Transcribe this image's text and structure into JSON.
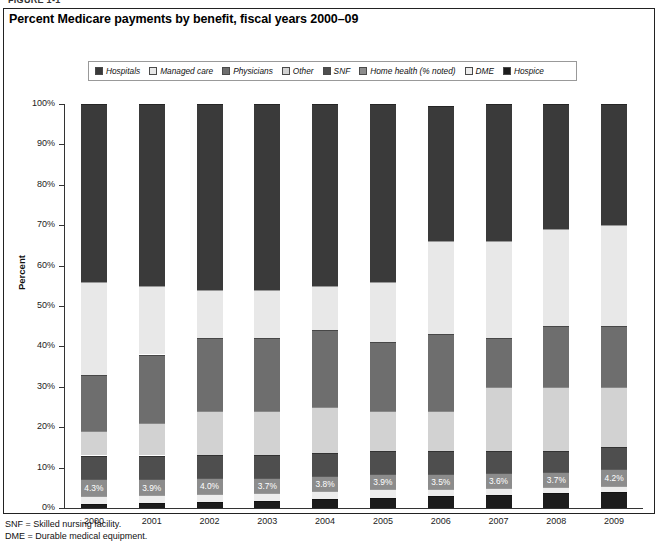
{
  "figure_label": "FIGURE 1-1",
  "title": "Percent Medicare payments by benefit, fiscal years 2000–09",
  "legend": {
    "items": [
      {
        "label": "Hospitals",
        "color": "#3a3a3a",
        "icon": "legend-swatch-icon"
      },
      {
        "label": "Managed care",
        "color": "#e8e8e8",
        "icon": "legend-swatch-icon"
      },
      {
        "label": "Physicians",
        "color": "#6e6e6e",
        "icon": "legend-swatch-icon"
      },
      {
        "label": "Other",
        "color": "#d2d2d2",
        "icon": "legend-swatch-icon"
      },
      {
        "label": "SNF",
        "color": "#4e4e4e",
        "icon": "legend-swatch-icon"
      },
      {
        "label": "Home health (% noted)",
        "color": "#8c8c8c",
        "icon": "legend-swatch-icon"
      },
      {
        "label": "DME",
        "color": "#ededed",
        "icon": "legend-swatch-icon"
      },
      {
        "label": "Hospice",
        "color": "#1c1c1c",
        "icon": "legend-swatch-icon"
      }
    ]
  },
  "footnotes": [
    "SNF = Skilled nursing facility.",
    "DME = Durable medical equipment."
  ],
  "chart_data": {
    "type": "bar",
    "subtype": "stacked-percent",
    "title": "Percent Medicare payments by benefit, fiscal years 2000–09",
    "xlabel": "",
    "ylabel": "Percent",
    "ylim": [
      0,
      100
    ],
    "ytick_labels": [
      "0%",
      "10%",
      "20%",
      "30%",
      "40%",
      "50%",
      "60%",
      "70%",
      "80%",
      "90%",
      "100%"
    ],
    "ytick_values": [
      0,
      10,
      20,
      30,
      40,
      50,
      60,
      70,
      80,
      90,
      100
    ],
    "grid": false,
    "legend_position": "top",
    "categories": [
      "2000",
      "2001",
      "2002",
      "2003",
      "2004",
      "2005",
      "2006",
      "2007",
      "2008",
      "2009"
    ],
    "stack_order_bottom_to_top": [
      "Hospice",
      "DME",
      "Home health (% noted)",
      "SNF",
      "Other",
      "Physicians",
      "Managed care",
      "Hospitals"
    ],
    "series": [
      {
        "name": "Hospice",
        "color": "#1c1c1c",
        "values": [
          1.0,
          1.2,
          1.5,
          1.8,
          2.2,
          2.6,
          3.0,
          3.3,
          3.6,
          3.9
        ]
      },
      {
        "name": "DME",
        "color": "#ededed",
        "values": [
          2.0,
          2.0,
          2.0,
          2.0,
          2.0,
          2.0,
          1.8,
          1.7,
          1.6,
          1.5
        ]
      },
      {
        "name": "Home health (% noted)",
        "color": "#8c8c8c",
        "values": [
          4.3,
          3.9,
          4.0,
          3.7,
          3.8,
          3.9,
          3.5,
          3.6,
          3.7,
          4.2
        ],
        "data_labels": [
          "4.3%",
          "3.9%",
          "4.0%",
          "3.7%",
          "3.8%",
          "3.9%",
          "3.5%",
          "3.6%",
          "3.7%",
          "4.2%"
        ]
      },
      {
        "name": "SNF",
        "color": "#4e4e4e",
        "values": [
          5.7,
          5.9,
          5.5,
          5.5,
          5.5,
          5.5,
          5.7,
          5.4,
          5.1,
          5.4
        ]
      },
      {
        "name": "Other",
        "color": "#d2d2d2",
        "values": [
          6.0,
          8.0,
          11.0,
          11.0,
          11.5,
          10.0,
          10.0,
          16.0,
          16.0,
          15.0
        ]
      },
      {
        "name": "Physicians",
        "color": "#6e6e6e",
        "values": [
          14.0,
          17.0,
          18.0,
          18.0,
          19.0,
          17.0,
          19.0,
          12.0,
          15.0,
          15.0
        ]
      },
      {
        "name": "Managed care",
        "color": "#e8e8e8",
        "values": [
          23.0,
          17.0,
          12.0,
          12.0,
          11.0,
          15.0,
          23.0,
          24.0,
          24.0,
          25.0
        ]
      },
      {
        "name": "Hospitals",
        "color": "#3a3a3a",
        "values": [
          44.0,
          45.0,
          46.0,
          46.0,
          45.0,
          44.0,
          33.5,
          34.0,
          31.0,
          30.0
        ]
      }
    ]
  }
}
